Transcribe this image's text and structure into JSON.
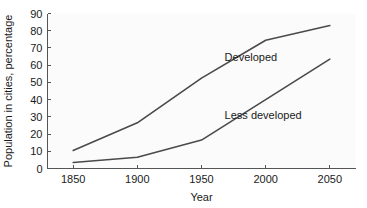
{
  "chart_data": {
    "type": "line",
    "title": "",
    "xlabel": "Year",
    "ylabel": "Population in cities, percentage",
    "x": [
      1850,
      1900,
      1950,
      2000,
      2050
    ],
    "xlim": [
      1830,
      2070
    ],
    "ylim": [
      0,
      90
    ],
    "xticks": [
      1850,
      1900,
      1950,
      2000,
      2050
    ],
    "xtick_labels": [
      "1850",
      "1900",
      "1950",
      "2000",
      "2050"
    ],
    "yticks": [
      0,
      10,
      20,
      30,
      40,
      50,
      60,
      70,
      80,
      90
    ],
    "ytick_labels": [
      "0",
      "10",
      "20",
      "30",
      "40",
      "50",
      "60",
      "70",
      "80",
      "90"
    ],
    "grid": false,
    "legend_position": "inline-annotation",
    "series": [
      {
        "name": "Developed",
        "values": [
          10.5,
          26.5,
          52.5,
          74.5,
          83.0
        ],
        "color": "#4a4a4a",
        "label_x": 1968,
        "label_y": 62.5
      },
      {
        "name": "Less developed",
        "values": [
          3.5,
          6.5,
          16.5,
          40.0,
          63.5
        ],
        "color": "#4a4a4a",
        "label_x": 1968,
        "label_y": 28.5
      }
    ]
  },
  "axis": {
    "x_title": "Year",
    "y_title": "Population in cities, percentage"
  },
  "colors": {
    "line": "#4a4a4a",
    "axis": "#555555",
    "text": "#1a1a1a",
    "plot_background": "#fbfbfb",
    "page_background": "#ffffff"
  }
}
